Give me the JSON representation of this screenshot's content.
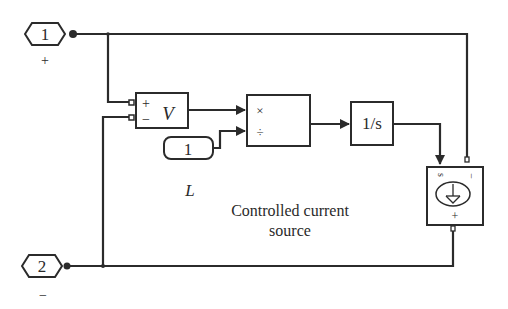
{
  "diagram": {
    "type": "simulink-block-diagram",
    "caption": [
      "Controlled current",
      "source"
    ],
    "ports": [
      {
        "id": "in1",
        "number": "1",
        "sign_label": "+"
      },
      {
        "id": "in2",
        "number": "2",
        "sign_label": "−"
      }
    ],
    "blocks": {
      "voltage_sensor": {
        "plus": "+",
        "minus": "−",
        "label": "V"
      },
      "product": {
        "mul": "×",
        "div": "÷"
      },
      "constant": {
        "value": "1",
        "name": "L"
      },
      "integrator": {
        "label": "1/s"
      },
      "current_source": {
        "s_label": "s",
        "minus_label": "−",
        "plus_label": "+"
      }
    },
    "colors": {
      "line": "#2b2b2b",
      "background": "#ffffff"
    }
  }
}
